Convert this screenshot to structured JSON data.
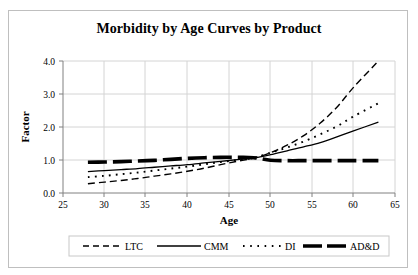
{
  "chart_data": {
    "type": "line",
    "title": "Morbidity by Age Curves by Product",
    "xlabel": "Age",
    "ylabel": "Factor",
    "xlim": [
      25,
      65
    ],
    "ylim": [
      0.0,
      4.0
    ],
    "xticks": [
      "25",
      "30",
      "35",
      "40",
      "45",
      "50",
      "55",
      "60",
      "65"
    ],
    "xtick_values": [
      25,
      30,
      35,
      40,
      45,
      50,
      55,
      60,
      65
    ],
    "yticks": [
      "0.0",
      "1.0",
      "2.0",
      "3.0",
      "4.0"
    ],
    "ytick_values": [
      0.0,
      1.0,
      2.0,
      3.0,
      4.0
    ],
    "grid": true,
    "legend_position": "bottom",
    "x": [
      28,
      30,
      32,
      34,
      36,
      38,
      40,
      42,
      44,
      46,
      48,
      50,
      52,
      54,
      56,
      58,
      60,
      63
    ],
    "series": [
      {
        "name": "LTC",
        "style": "dashed",
        "color": "#000000",
        "values": [
          0.28,
          0.33,
          0.38,
          0.44,
          0.51,
          0.58,
          0.66,
          0.75,
          0.86,
          0.96,
          1.06,
          1.22,
          1.45,
          1.74,
          2.12,
          2.6,
          3.2,
          4.0
        ]
      },
      {
        "name": "CMM",
        "style": "solid",
        "color": "#000000",
        "values": [
          0.65,
          0.68,
          0.71,
          0.74,
          0.78,
          0.82,
          0.86,
          0.91,
          0.96,
          1.01,
          1.06,
          1.16,
          1.28,
          1.4,
          1.53,
          1.7,
          1.88,
          2.15
        ]
      },
      {
        "name": "DI",
        "style": "dotted",
        "color": "#000000",
        "values": [
          0.48,
          0.52,
          0.57,
          0.62,
          0.68,
          0.74,
          0.8,
          0.87,
          0.94,
          1.0,
          1.07,
          1.22,
          1.38,
          1.56,
          1.78,
          2.02,
          2.32,
          2.72
        ]
      },
      {
        "name": "AD&D",
        "style": "thick-dashed",
        "color": "#000000",
        "values": [
          0.93,
          0.94,
          0.95,
          0.97,
          0.99,
          1.02,
          1.05,
          1.07,
          1.08,
          1.08,
          1.07,
          0.99,
          0.98,
          0.98,
          0.98,
          0.98,
          0.98,
          0.98
        ]
      }
    ],
    "legend": [
      {
        "label": "LTC",
        "style": "dashed"
      },
      {
        "label": "CMM",
        "style": "solid"
      },
      {
        "label": "DI",
        "style": "dotted"
      },
      {
        "label": "AD&D",
        "style": "thick-dashed"
      }
    ]
  }
}
